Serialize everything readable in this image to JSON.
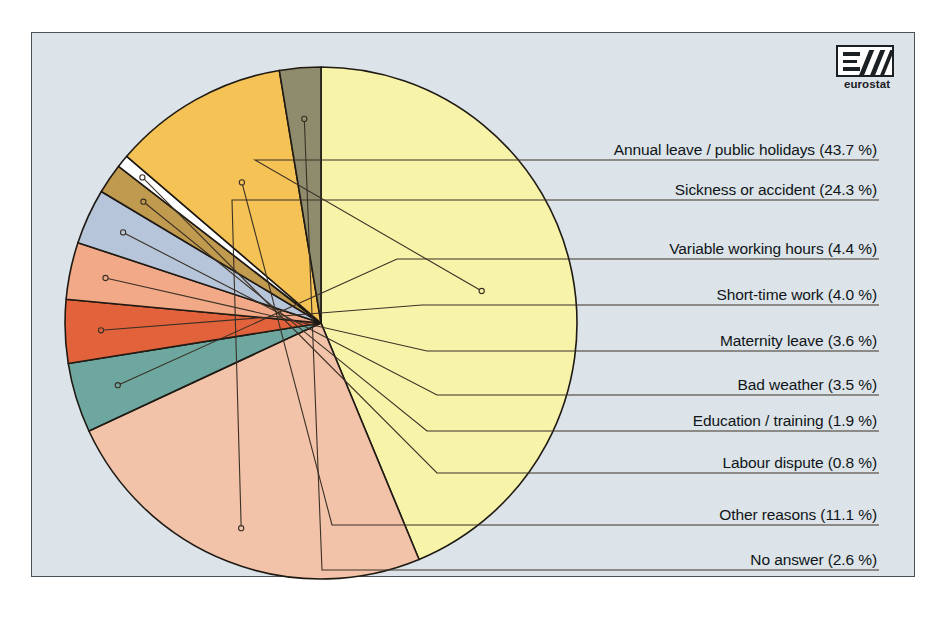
{
  "logo": {
    "wordmark": "eurostat",
    "mark_name": "eurostat-logo"
  },
  "chart_data": {
    "type": "pie",
    "title": "",
    "legend_position": "right",
    "total": 99.9,
    "unit": "%",
    "categories": [
      "Annual leave / public holidays",
      "Sickness or accident",
      "Variable working hours",
      "Short-time work",
      "Maternity leave",
      "Bad weather",
      "Education / training",
      "Labour dispute",
      "Other reasons",
      "No answer"
    ],
    "values": [
      43.7,
      24.3,
      4.4,
      4.0,
      3.6,
      3.5,
      1.9,
      0.8,
      11.1,
      2.6
    ],
    "labels": [
      "Annual leave / public holidays (43.7 %)",
      "Sickness or accident (24.3 %)",
      "Variable working hours (4.4 %)",
      "Short-time work (4.0 %)",
      "Maternity leave (3.6 %)",
      "Bad weather (3.5 %)",
      "Education / training (1.9 %)",
      "Labour dispute (0.8 %)",
      "Other reasons (11.1 %)",
      "No answer (2.6 %)"
    ],
    "colors": [
      "#f2c3a8",
      "#f2c3a8",
      "#6ea79f",
      "#e2623c",
      "#f2a988",
      "#b6c5da",
      "#c09a4e",
      "#ffffff",
      "#f4c255",
      "#8e8c6c"
    ],
    "slice_colors": {
      "annual_leave": "#f7f3a9",
      "sickness": "#f2c3a8",
      "variable_hours": "#6ea79f",
      "short_time": "#e2623c",
      "maternity": "#f2a988",
      "bad_weather": "#b6c5da",
      "education": "#c09a4e",
      "labour_dispute": "#ffffff",
      "other_reasons": "#f4c255",
      "no_answer": "#8e8c6c"
    },
    "background": "#dce4e9",
    "border_color": "#4a5257"
  }
}
